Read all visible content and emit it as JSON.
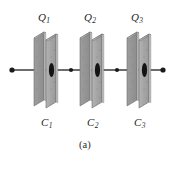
{
  "figure": {
    "caption": "(a)",
    "background_color": "#ffffff",
    "plate_color": "#a8a8a8",
    "plate_shade_color": "#8f8f8f",
    "plate_edge_color": "#6e6e6e",
    "wire_color": "#3a3a3a",
    "node_color": "#1a1a1a",
    "label_color": "#262626"
  },
  "charge_labels": [
    {
      "symbol": "Q",
      "subscript": "1",
      "x": 38,
      "y": 12
    },
    {
      "symbol": "Q",
      "subscript": "2",
      "x": 84,
      "y": 12
    },
    {
      "symbol": "Q",
      "subscript": "3",
      "x": 131,
      "y": 12
    }
  ],
  "capacitor_labels": [
    {
      "symbol": "C",
      "subscript": "1",
      "x": 41,
      "y": 117
    },
    {
      "symbol": "C",
      "subscript": "2",
      "x": 87,
      "y": 117
    },
    {
      "symbol": "C",
      "subscript": "3",
      "x": 134,
      "y": 117
    }
  ],
  "capacitors": [
    {
      "name": "capacitor-1",
      "cx": 48
    },
    {
      "name": "capacitor-2",
      "cx": 94
    },
    {
      "name": "capacitor-3",
      "cx": 141
    }
  ],
  "wire": {
    "y": 70,
    "x_start": 12,
    "x_end": 163,
    "terminal_dots": [
      {
        "x": 12
      },
      {
        "x": 163
      }
    ],
    "junction_dots": [
      {
        "x": 71
      },
      {
        "x": 117
      }
    ]
  }
}
